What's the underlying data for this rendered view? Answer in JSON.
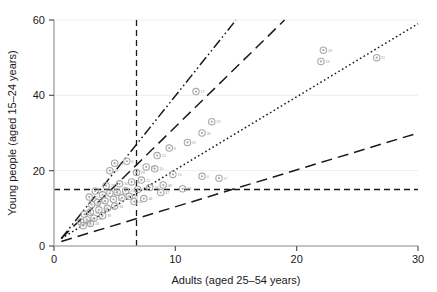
{
  "chart_data": {
    "type": "scatter",
    "title": "",
    "xlabel": "Adults (aged 25–54 years)",
    "ylabel": "Young people (aged 15–24 years)",
    "xlim": [
      0,
      30
    ],
    "ylim": [
      0,
      60
    ],
    "xticks": [
      0,
      10,
      20,
      30
    ],
    "yticks": [
      0,
      20,
      40,
      60
    ],
    "xtick_labels": [
      "0",
      "10",
      "20",
      "30"
    ],
    "ytick_labels": [
      "0",
      "20",
      "40",
      "60"
    ],
    "grid": "horizontal-light",
    "legend": "none",
    "marker": {
      "shape": "circle",
      "color": "#a8a8a8",
      "size": 3.2,
      "label_color": "#9a9a9a"
    },
    "reference_lines": [
      {
        "name": "vertical-reference",
        "orientation": "vertical",
        "value": 6.8,
        "style": "dashed",
        "color": "#1a1a1a"
      },
      {
        "name": "horizontal-reference",
        "orientation": "horizontal",
        "value": 15.0,
        "style": "dashed",
        "color": "#1a1a1a"
      }
    ],
    "trend_lines": [
      {
        "name": "ratio-line-4x",
        "style": "dash-dot-dot",
        "color": "#1a1a1a",
        "x0": 0.6,
        "y0": 2.0,
        "x1": 15.0,
        "y1": 60.0,
        "slope": 4.03
      },
      {
        "name": "ratio-line-3x",
        "style": "long-dash",
        "color": "#1a1a1a",
        "x0": 0.6,
        "y0": 2.0,
        "x1": 19.0,
        "y1": 60.0,
        "slope": 3.15
      },
      {
        "name": "ratio-line-2x",
        "style": "dotted",
        "color": "#1a1a1a",
        "x0": 0.6,
        "y0": 2.0,
        "x1": 30.0,
        "y1": 59.0,
        "slope": 1.94
      },
      {
        "name": "ratio-line-1x",
        "style": "long-dash",
        "color": "#1a1a1a",
        "x0": 0.6,
        "y0": 1.2,
        "x1": 30.0,
        "y1": 30.0,
        "slope": 0.98
      }
    ],
    "points": [
      {
        "x": 22.2,
        "y": 52.0,
        "label": "23"
      },
      {
        "x": 22.0,
        "y": 49.0,
        "label": "24"
      },
      {
        "x": 26.6,
        "y": 50.0,
        "label": "11"
      },
      {
        "x": 11.7,
        "y": 41.0,
        "label": "17"
      },
      {
        "x": 13.0,
        "y": 33.0,
        "label": "13"
      },
      {
        "x": 12.2,
        "y": 30.0,
        "label": "26"
      },
      {
        "x": 11.0,
        "y": 27.5,
        "label": "31"
      },
      {
        "x": 9.5,
        "y": 26.0,
        "label": "8"
      },
      {
        "x": 8.5,
        "y": 24.0,
        "label": "12"
      },
      {
        "x": 5.0,
        "y": 22.0,
        "label": "21"
      },
      {
        "x": 6.0,
        "y": 22.5,
        "label": "6"
      },
      {
        "x": 7.6,
        "y": 21.0,
        "label": "14"
      },
      {
        "x": 8.3,
        "y": 20.5,
        "label": "10"
      },
      {
        "x": 4.6,
        "y": 20.0,
        "label": "27"
      },
      {
        "x": 6.8,
        "y": 19.5,
        "label": "29"
      },
      {
        "x": 9.8,
        "y": 19.0,
        "label": "15"
      },
      {
        "x": 12.2,
        "y": 18.5,
        "label": "4"
      },
      {
        "x": 13.6,
        "y": 18.0,
        "label": "17"
      },
      {
        "x": 7.2,
        "y": 17.5,
        "label": "22"
      },
      {
        "x": 6.4,
        "y": 17.0,
        "label": "5"
      },
      {
        "x": 5.4,
        "y": 16.5,
        "label": "30"
      },
      {
        "x": 4.3,
        "y": 16.0,
        "label": "28"
      },
      {
        "x": 7.9,
        "y": 15.5,
        "label": "18"
      },
      {
        "x": 6.9,
        "y": 15.0,
        "label": "9"
      },
      {
        "x": 5.9,
        "y": 14.7,
        "label": "25"
      },
      {
        "x": 5.2,
        "y": 14.3,
        "label": "2"
      },
      {
        "x": 4.6,
        "y": 14.0,
        "label": "19"
      },
      {
        "x": 4.0,
        "y": 13.6,
        "label": "7"
      },
      {
        "x": 6.2,
        "y": 13.2,
        "label": "20"
      },
      {
        "x": 5.6,
        "y": 12.8,
        "label": "3"
      },
      {
        "x": 4.9,
        "y": 12.4,
        "label": "16"
      },
      {
        "x": 4.2,
        "y": 12.0,
        "label": "1"
      },
      {
        "x": 3.6,
        "y": 11.6,
        "label": "32"
      },
      {
        "x": 3.1,
        "y": 11.0,
        "label": "33"
      },
      {
        "x": 5.0,
        "y": 10.6,
        "label": "34"
      },
      {
        "x": 4.4,
        "y": 10.0,
        "label": "35"
      },
      {
        "x": 3.7,
        "y": 9.6,
        "label": "36"
      },
      {
        "x": 3.0,
        "y": 9.0,
        "label": "37"
      },
      {
        "x": 2.5,
        "y": 8.4,
        "label": "38"
      },
      {
        "x": 4.0,
        "y": 8.0,
        "label": "39"
      },
      {
        "x": 3.3,
        "y": 7.4,
        "label": "40"
      },
      {
        "x": 2.7,
        "y": 7.0,
        "label": "41"
      },
      {
        "x": 2.2,
        "y": 6.4,
        "label": "42"
      },
      {
        "x": 3.0,
        "y": 6.0,
        "label": "43"
      },
      {
        "x": 2.4,
        "y": 5.4,
        "label": "44"
      },
      {
        "x": 6.6,
        "y": 11.8,
        "label": "45"
      },
      {
        "x": 7.4,
        "y": 12.6,
        "label": "46"
      },
      {
        "x": 8.8,
        "y": 14.2,
        "label": "47"
      },
      {
        "x": 9.0,
        "y": 16.2,
        "label": "48"
      },
      {
        "x": 10.6,
        "y": 15.2,
        "label": "49"
      },
      {
        "x": 2.9,
        "y": 13.0,
        "label": "50"
      },
      {
        "x": 3.4,
        "y": 14.6,
        "label": "51"
      }
    ]
  }
}
